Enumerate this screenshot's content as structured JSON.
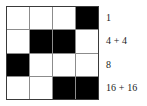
{
  "figure": {
    "type": "binary-grid-diagram",
    "background_color": "#ffffff",
    "grid": {
      "rows": 4,
      "columns": 4,
      "cell_empty_color": "#ffffff",
      "cell_filled_color": "#000000",
      "gridline_color": "#8c8c8c",
      "border_color": "#3a3a3a",
      "rows_data": [
        {
          "index": 0,
          "cells": [
            "empty",
            "empty",
            "empty",
            "filled"
          ],
          "label": "1"
        },
        {
          "index": 1,
          "cells": [
            "empty",
            "filled",
            "filled",
            "empty"
          ],
          "label": "4 + 4"
        },
        {
          "index": 2,
          "cells": [
            "filled",
            "empty",
            "empty",
            "empty"
          ],
          "label": "8"
        },
        {
          "index": 3,
          "cells": [
            "empty",
            "empty",
            "filled",
            "filled"
          ],
          "label": "16 + 16"
        }
      ]
    },
    "labels": {
      "text_color": "#1c1c1c",
      "items": [
        "1",
        "4 + 4",
        "8",
        "16 + 16"
      ]
    }
  }
}
